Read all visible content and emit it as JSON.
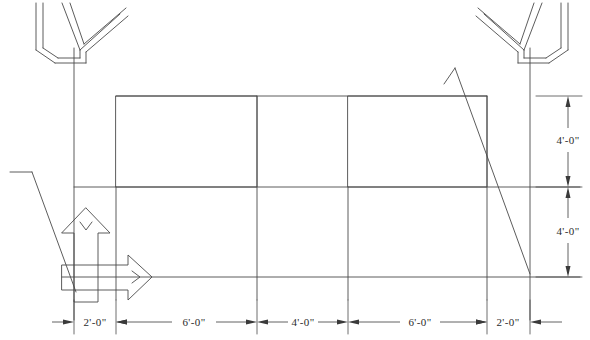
{
  "drawing": {
    "type": "architectural-elevation",
    "background_color": "#ffffff",
    "line_color": "#4a4a4a",
    "heavy_line_color": "#3a3a3a",
    "text_color": "#2b2b2b",
    "width": 590,
    "height": 340
  },
  "dimensions": {
    "horizontal": [
      {
        "id": "h1",
        "label": "2'-0\"",
        "x1": 74,
        "x2": 116
      },
      {
        "id": "h2",
        "label": "6'-0\"",
        "x1": 116,
        "x2": 257
      },
      {
        "id": "h3",
        "label": "4'-0\"",
        "x1": 257,
        "x2": 348
      },
      {
        "id": "h4",
        "label": "6'-0\"",
        "x1": 348,
        "x2": 487
      },
      {
        "id": "h5",
        "label": "2'-0\"",
        "x1": 487,
        "x2": 530
      }
    ],
    "vertical": [
      {
        "id": "v1",
        "label": "4'-0\"",
        "y1": 96,
        "y2": 187
      },
      {
        "id": "v2",
        "label": "4'-0\"",
        "y1": 187,
        "y2": 277
      }
    ],
    "dim_line_y": 322,
    "dim_line_x": 568
  },
  "panels": [
    {
      "id": "left-panel",
      "x": 116,
      "y": 96,
      "w": 141,
      "h": 91
    },
    {
      "id": "right-panel",
      "x": 348,
      "y": 96,
      "w": 139,
      "h": 91
    }
  ],
  "annotations": {
    "up_arrow": {
      "name": "load-arrow-up",
      "tip_y": 208,
      "base_y": 302,
      "x_left": 62,
      "x_right": 110
    },
    "right_arrow": {
      "name": "load-arrow-right",
      "tip_x": 152,
      "base_x": 62,
      "y_top": 255,
      "y_bottom": 300
    }
  },
  "structure": {
    "posts": [
      {
        "id": "left-post",
        "x": 74,
        "y1": 48,
        "y2": 320
      },
      {
        "id": "right-post",
        "x": 530,
        "y1": 48,
        "y2": 320
      }
    ],
    "brackets": [
      {
        "id": "left-bracket",
        "side": "left"
      },
      {
        "id": "right-bracket",
        "side": "right"
      }
    ],
    "grade_line_y": 277,
    "mid_rail_y": 187,
    "head_line_y": 96
  }
}
